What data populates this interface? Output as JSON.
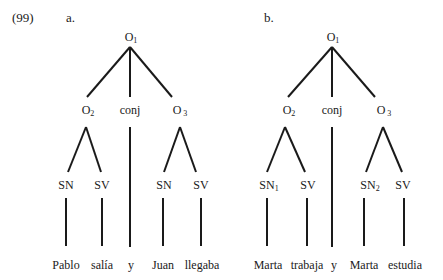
{
  "example": {
    "number": "(99)"
  },
  "trees": [
    {
      "id": "a",
      "label": "a.",
      "root": {
        "text": "O",
        "sub": "1"
      },
      "children": [
        {
          "text": "O",
          "sub": "2",
          "children": [
            {
              "text": "SN",
              "sub": "",
              "leaf": "Pablo"
            },
            {
              "text": "SV",
              "sub": "",
              "leaf": "salía"
            }
          ]
        },
        {
          "text": "conj",
          "sub": "",
          "leaf": "y"
        },
        {
          "text": "O",
          "sub": " 3",
          "children": [
            {
              "text": "SN",
              "sub": "",
              "leaf": "Juan"
            },
            {
              "text": "SV",
              "sub": "",
              "leaf": "llegaba"
            }
          ]
        }
      ]
    },
    {
      "id": "b",
      "label": "b.",
      "root": {
        "text": "O",
        "sub": "1"
      },
      "children": [
        {
          "text": "O",
          "sub": "2",
          "children": [
            {
              "text": "SN",
              "sub": "1",
              "leaf": "Marta"
            },
            {
              "text": "SV",
              "sub": "",
              "leaf": "trabaja"
            }
          ]
        },
        {
          "text": "conj",
          "sub": "",
          "leaf": "y"
        },
        {
          "text": "O",
          "sub": " 3",
          "children": [
            {
              "text": "SN",
              "sub": "2",
              "leaf": "Marta"
            },
            {
              "text": "SV",
              "sub": "",
              "leaf": "estudia"
            }
          ]
        }
      ]
    }
  ]
}
